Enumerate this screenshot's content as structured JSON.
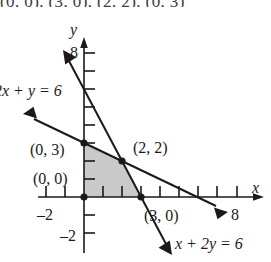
{
  "figure": {
    "caption_above": "(0, 0), (3, 0), (2, 2), (0, 3)",
    "axes": {
      "x_label": "x",
      "y_label": "y",
      "x_ticks_labeled": [
        {
          "value": -2,
          "text": "–2"
        },
        {
          "value": 8,
          "text": "8"
        }
      ],
      "y_ticks_labeled": [
        {
          "value": 8,
          "text": "8"
        },
        {
          "value": -2,
          "text": "–2"
        }
      ],
      "x_range": [
        -3,
        9.5
      ],
      "y_range": [
        -3,
        9
      ],
      "tick_interval": 1,
      "grid": false
    },
    "lines": [
      {
        "id": "line-2x-plus-y",
        "equation_label": "2x + y = 6",
        "slope": -2,
        "intercept": 6,
        "x_intercept": 3,
        "y_intercept": 6,
        "arrows": "both"
      },
      {
        "id": "line-x-plus-2y",
        "equation_label": "x + 2y = 6",
        "slope": -0.5,
        "intercept": 3,
        "x_intercept": 6,
        "y_intercept": 3,
        "arrows": "both"
      }
    ],
    "region": {
      "name": "feasible-region",
      "fill_color": "#c9c9c9",
      "vertices": [
        {
          "label": "(0, 0)",
          "x": 0,
          "y": 0
        },
        {
          "label": "(3, 0)",
          "x": 3,
          "y": 0
        },
        {
          "label": "(2, 2)",
          "x": 2,
          "y": 2
        },
        {
          "label": "(0, 3)",
          "x": 0,
          "y": 3
        }
      ]
    },
    "colors": {
      "ink": "#1a1a1a",
      "shade": "#c9c9c9",
      "background": "#ffffff"
    }
  }
}
